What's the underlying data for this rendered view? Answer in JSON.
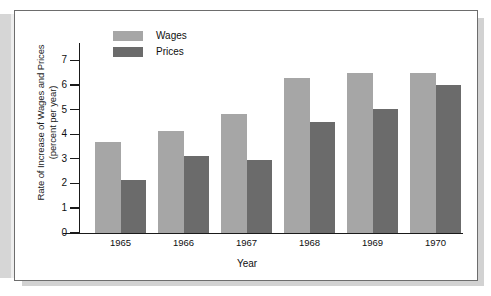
{
  "chart_data": {
    "type": "bar",
    "title": "",
    "xlabel": "Year",
    "ylabel": "Rate of Increase of Wages and Prices (percent per year)",
    "ylabel_line1": "Rate of Increase of Wages and Prices",
    "ylabel_line2": "(percent per year)",
    "categories": [
      "1965",
      "1966",
      "1967",
      "1968",
      "1969",
      "1970"
    ],
    "series": [
      {
        "name": "Wages",
        "color": "#a6a6a6",
        "values": [
          3.7,
          4.15,
          4.85,
          6.3,
          6.5,
          6.5
        ]
      },
      {
        "name": "Prices",
        "color": "#6b6b6b",
        "values": [
          2.15,
          3.15,
          2.95,
          4.5,
          5.05,
          6.0
        ]
      }
    ],
    "ylim": [
      0,
      7.6
    ],
    "yticks": [
      0,
      1,
      2,
      3,
      4,
      5,
      6,
      7
    ],
    "ytick_labels": [
      "0",
      "1",
      "2",
      "3",
      "4",
      "5",
      "6",
      "7"
    ],
    "grid": false,
    "legend_position": "top-left-inside"
  }
}
